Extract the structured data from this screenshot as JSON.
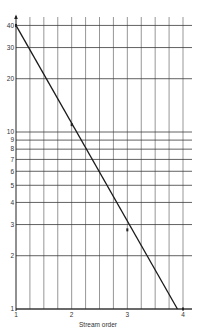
{
  "chart_data": {
    "type": "line",
    "title": "",
    "xlabel": "Stream order",
    "ylabel": "",
    "x_scale": "linear",
    "y_scale": "log",
    "xlim": [
      1,
      4
    ],
    "ylim": [
      1,
      40
    ],
    "grid": true,
    "x_ticks": [
      1,
      2,
      3,
      4
    ],
    "x_tick_labels": [
      "1",
      "2",
      "3",
      "4"
    ],
    "x_minor_step": 0.25,
    "y_ticks": [
      1,
      2,
      3,
      4,
      5,
      6,
      7,
      8,
      9,
      10,
      20,
      30,
      40
    ],
    "y_tick_labels": [
      "1",
      "2",
      "3",
      "4",
      "5",
      "6",
      "7",
      "8",
      "9",
      "10",
      "20",
      "30",
      "40"
    ],
    "series": [
      {
        "name": "fitted line",
        "kind": "line",
        "x": [
          1,
          3.9
        ],
        "y": [
          40,
          1
        ]
      },
      {
        "name": "observed",
        "kind": "points",
        "x": [
          1,
          2,
          3,
          4
        ],
        "y": [
          40,
          11,
          2.8,
          1
        ]
      }
    ]
  },
  "labels": {
    "xlabel": "Stream order"
  }
}
